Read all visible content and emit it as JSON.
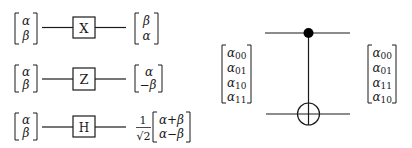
{
  "single_qubit_gates": [
    {
      "gate": "X",
      "input": [
        "α",
        "β"
      ],
      "output": [
        "β",
        "α"
      ],
      "prefactor": null
    },
    {
      "gate": "Z",
      "input": [
        "α",
        "β"
      ],
      "output": [
        "α",
        "−β"
      ],
      "prefactor": null
    },
    {
      "gate": "H",
      "input": [
        "α",
        "β"
      ],
      "output": [
        "α+β",
        "α−β"
      ],
      "prefactor": {
        "numerator": "1",
        "denominator": "√2"
      }
    }
  ],
  "cnot": {
    "gate": "CNOT",
    "control_symbol": "filled-dot",
    "target_symbol": "oplus",
    "input": [
      {
        "base": "α",
        "sub": "00"
      },
      {
        "base": "α",
        "sub": "01"
      },
      {
        "base": "α",
        "sub": "10"
      },
      {
        "base": "α",
        "sub": "11"
      }
    ],
    "output": [
      {
        "base": "α",
        "sub": "00"
      },
      {
        "base": "α",
        "sub": "01"
      },
      {
        "base": "α",
        "sub": "11"
      },
      {
        "base": "α",
        "sub": "10"
      }
    ]
  },
  "colors": {
    "ink": "#1a1a1a",
    "background": "#ffffff"
  }
}
